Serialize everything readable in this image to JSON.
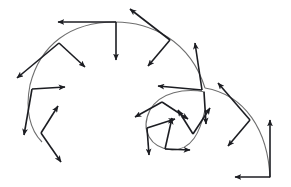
{
  "diagram": {
    "colors": {
      "background": "#ffffff",
      "curve": "#6f6f6f",
      "arrow": "#1c1d22"
    },
    "curves": [
      {
        "name": "outer-spiral",
        "d": "M270,178 C268,130 245,95 205,88 M205,88 C190,40 150,22 115,22 C70,22 40,45 30,85 C25,110 30,130 42,142"
      },
      {
        "name": "inner-loop",
        "d": "M205,92 C185,88 160,92 150,110 C140,130 150,148 172,150 C192,150 200,132 205,110"
      }
    ],
    "arrows": [
      {
        "x1": 116,
        "y1": 22,
        "x2": 58,
        "y2": 22
      },
      {
        "x1": 116,
        "y1": 22,
        "x2": 116,
        "y2": 60
      },
      {
        "x1": 170,
        "y1": 40,
        "x2": 130,
        "y2": 9
      },
      {
        "x1": 170,
        "y1": 40,
        "x2": 148,
        "y2": 66
      },
      {
        "x1": 59,
        "y1": 43,
        "x2": 17,
        "y2": 78
      },
      {
        "x1": 59,
        "y1": 43,
        "x2": 85,
        "y2": 67
      },
      {
        "x1": 32,
        "y1": 89,
        "x2": 65,
        "y2": 87
      },
      {
        "x1": 32,
        "y1": 89,
        "x2": 24,
        "y2": 135
      },
      {
        "x1": 41,
        "y1": 133,
        "x2": 58,
        "y2": 106
      },
      {
        "x1": 41,
        "y1": 133,
        "x2": 61,
        "y2": 162
      },
      {
        "x1": 202,
        "y1": 90,
        "x2": 158,
        "y2": 86
      },
      {
        "x1": 202,
        "y1": 90,
        "x2": 195,
        "y2": 43
      },
      {
        "x1": 250,
        "y1": 120,
        "x2": 218,
        "y2": 83
      },
      {
        "x1": 250,
        "y1": 120,
        "x2": 228,
        "y2": 146
      },
      {
        "x1": 270,
        "y1": 177,
        "x2": 270,
        "y2": 120
      },
      {
        "x1": 270,
        "y1": 177,
        "x2": 235,
        "y2": 177
      },
      {
        "x1": 162,
        "y1": 102,
        "x2": 135,
        "y2": 117
      },
      {
        "x1": 162,
        "y1": 102,
        "x2": 188,
        "y2": 119
      },
      {
        "x1": 147,
        "y1": 128,
        "x2": 175,
        "y2": 119
      },
      {
        "x1": 147,
        "y1": 128,
        "x2": 149,
        "y2": 155
      },
      {
        "x1": 165,
        "y1": 149,
        "x2": 190,
        "y2": 150
      },
      {
        "x1": 165,
        "y1": 149,
        "x2": 172,
        "y2": 118
      },
      {
        "x1": 193,
        "y1": 134,
        "x2": 210,
        "y2": 108
      },
      {
        "x1": 193,
        "y1": 134,
        "x2": 178,
        "y2": 110
      },
      {
        "x1": 204,
        "y1": 92,
        "x2": 206,
        "y2": 124
      }
    ]
  }
}
